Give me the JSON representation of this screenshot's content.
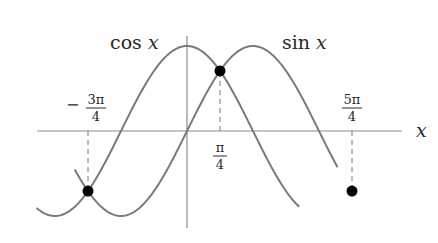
{
  "chart_data": {
    "type": "line",
    "title": "",
    "xlabel": "x",
    "ylabel": "",
    "series": [
      {
        "name": "cos x",
        "label": "cos x",
        "function": "cos",
        "x_range_pi": [
          -1.14,
          0.85
        ]
      },
      {
        "name": "sin x",
        "label": "sin x",
        "function": "sin",
        "x_range_pi": [
          -0.85,
          1.14
        ]
      }
    ],
    "intersections": [
      {
        "x_label": "−3π/4",
        "x": -2.356,
        "y": -0.707
      },
      {
        "x_label": "π/4",
        "x": 0.785,
        "y": 0.707
      },
      {
        "x_label": "5π/4",
        "x": 3.927,
        "y": -0.707
      }
    ],
    "tick_labels": [
      {
        "sign": "−",
        "num": "3π",
        "den": "4"
      },
      {
        "sign": "",
        "num": "π",
        "den": "4"
      },
      {
        "sign": "",
        "num": "5π",
        "den": "4"
      }
    ],
    "axis_label": "x",
    "grid": false,
    "colors": {
      "curves": "#7a7a7a",
      "axes": "#8c8c8c",
      "points": "#000000"
    }
  }
}
